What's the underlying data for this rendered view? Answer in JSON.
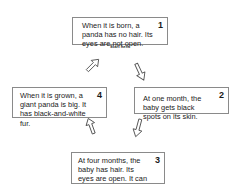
{
  "diagram": {
    "type": "life-cycle",
    "start_label": "Start here",
    "stages": [
      {
        "number": "1",
        "text": "When it is born, a panda has no hair. Its eyes are not open."
      },
      {
        "number": "2",
        "text": "At one month, the baby gets black spots on its skin."
      },
      {
        "number": "3",
        "text": "At four months, the baby has hair. Its eyes are open. It can crawl."
      },
      {
        "number": "4",
        "text": "When it is grown, a giant panda is big. It has black-and-white fur."
      }
    ],
    "arrows": [
      {
        "from": "1",
        "to": "2",
        "direction": "down-right"
      },
      {
        "from": "2",
        "to": "3",
        "direction": "down-left"
      },
      {
        "from": "3",
        "to": "4",
        "direction": "up"
      },
      {
        "from": "4",
        "to": "1",
        "direction": "up-right"
      }
    ]
  }
}
